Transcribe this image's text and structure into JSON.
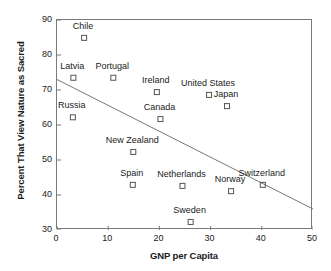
{
  "chart_data": {
    "type": "scatter",
    "title": "",
    "xlabel": "GNP per Capita",
    "ylabel": "Percent That View Nature as Sacred",
    "xlim": [
      0,
      50
    ],
    "ylim": [
      30,
      90
    ],
    "xticks": [
      0,
      10,
      20,
      30,
      40,
      50
    ],
    "yticks": [
      30,
      40,
      50,
      60,
      70,
      80,
      90
    ],
    "grid": false,
    "legend": false,
    "marker": "open-square",
    "points": [
      {
        "label": "Chile",
        "x": 5.3,
        "y": 84.9,
        "label_dx": 0,
        "label_dy": -11
      },
      {
        "label": "Latvia",
        "x": 3.2,
        "y": 73.5,
        "label_dx": 0,
        "label_dy": -11
      },
      {
        "label": "Portugal",
        "x": 11.0,
        "y": 73.5,
        "label_dx": 0,
        "label_dy": -11
      },
      {
        "label": "Ireland",
        "x": 19.5,
        "y": 69.4,
        "label_dx": 0,
        "label_dy": -11
      },
      {
        "label": "United States",
        "x": 29.7,
        "y": 68.6,
        "label_dx": 0,
        "label_dy": -11
      },
      {
        "label": "Japan",
        "x": 33.2,
        "y": 65.4,
        "label_dx": 0,
        "label_dy": -11
      },
      {
        "label": "Russia",
        "x": 3.1,
        "y": 62.2,
        "label_dx": 0,
        "label_dy": -11
      },
      {
        "label": "Canada",
        "x": 20.2,
        "y": 61.7,
        "label_dx": 0,
        "label_dy": -11
      },
      {
        "label": "New Zealand",
        "x": 14.9,
        "y": 52.3,
        "label_dx": 0,
        "label_dy": -11
      },
      {
        "label": "Spain",
        "x": 14.8,
        "y": 42.9,
        "label_dx": 0,
        "label_dy": -11
      },
      {
        "label": "Netherlands",
        "x": 24.5,
        "y": 42.6,
        "label_dx": 0,
        "label_dy": -11
      },
      {
        "label": "Norway",
        "x": 34.0,
        "y": 41.1,
        "label_dx": 0,
        "label_dy": -11
      },
      {
        "label": "Switzerland",
        "x": 40.2,
        "y": 42.9,
        "label_dx": 0,
        "label_dy": -11
      },
      {
        "label": "Sweden",
        "x": 26.1,
        "y": 32.3,
        "label_dx": 0,
        "label_dy": -11
      }
    ],
    "trend_line": {
      "x0": 0,
      "y0": 73.0,
      "x1": 50,
      "y1": 36.0
    },
    "colors": {
      "axis": "#7a7a7a",
      "marker": "#555555",
      "line": "#777777",
      "text": "#1a1a1a"
    }
  }
}
